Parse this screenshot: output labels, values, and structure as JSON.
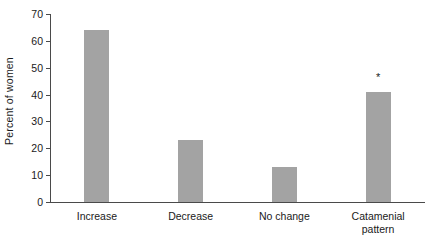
{
  "chart_data": {
    "type": "bar",
    "title": "",
    "subtitle": "",
    "xlabel": "",
    "ylabel": "Percent of women",
    "categories": [
      "Increase",
      "Decrease",
      "No change",
      "Catamenial\npattern"
    ],
    "values": [
      64,
      23,
      13,
      41
    ],
    "ylim": [
      0,
      70
    ],
    "yticks": [
      0,
      10,
      20,
      30,
      40,
      50,
      60,
      70
    ],
    "ytick_labels": [
      "0",
      "10",
      "20",
      "30",
      "40",
      "50",
      "60",
      "70"
    ],
    "grid": false,
    "legend": null,
    "annotations": [
      {
        "series_index": 3,
        "category": "Catamenial\npattern",
        "text": "*",
        "value": 46
      }
    ],
    "bar_color": "#a3a3a3",
    "axis_color": "#4a4a4a"
  }
}
